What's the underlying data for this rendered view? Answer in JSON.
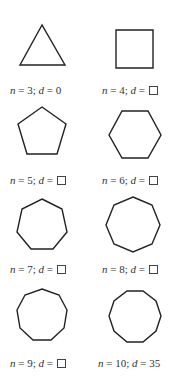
{
  "figure": {
    "stroke_color": "#222222",
    "text_color": "#333333",
    "polygons": [
      {
        "id": "triangle",
        "n": 3,
        "d_value": "0",
        "d_blank": false,
        "label_n": "3",
        "label_d": "0"
      },
      {
        "id": "square",
        "n": 4,
        "d_value": "",
        "d_blank": true,
        "label_n": "4",
        "label_d": ""
      },
      {
        "id": "pentagon",
        "n": 5,
        "d_value": "",
        "d_blank": true,
        "label_n": "5",
        "label_d": ""
      },
      {
        "id": "hexagon",
        "n": 6,
        "d_value": "",
        "d_blank": true,
        "label_n": "6",
        "label_d": ""
      },
      {
        "id": "heptagon",
        "n": 7,
        "d_value": "",
        "d_blank": true,
        "label_n": "7",
        "label_d": ""
      },
      {
        "id": "octagon",
        "n": 8,
        "d_value": "",
        "d_blank": true,
        "label_n": "8",
        "label_d": ""
      },
      {
        "id": "nonagon",
        "n": 9,
        "d_value": "",
        "d_blank": true,
        "label_n": "9",
        "label_d": ""
      },
      {
        "id": "decagon",
        "n": 10,
        "d_value": "35",
        "d_blank": false,
        "label_n": "10",
        "label_d": "35"
      }
    ],
    "label_parts": {
      "n_var": "n",
      "d_var": "d",
      "equals": " = ",
      "separator": "; "
    }
  }
}
